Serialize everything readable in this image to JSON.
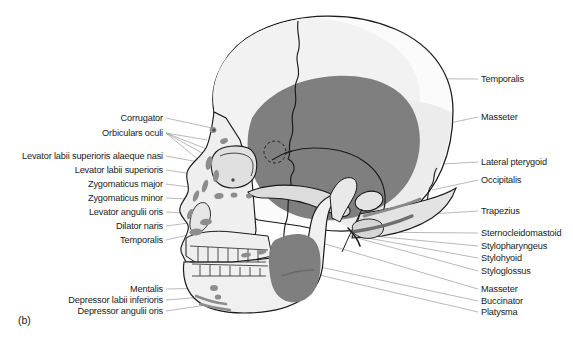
{
  "figure": {
    "caption": "(b)",
    "colors": {
      "background": "#ffffff",
      "bone_light": "#f4f4f4",
      "bone_mid": "#e2e2e2",
      "bone_shadow": "#cfcfcf",
      "muscle_dark": "#808080",
      "muscle_mark": "#9a9a9a",
      "outline": "#1a1a1a",
      "leader": "#9b9b9b",
      "text": "#1a1a1a"
    }
  },
  "labels_left": [
    {
      "text": "Corrugator",
      "x": 163,
      "y": 118,
      "tip_x": 212,
      "tip_y": 128
    },
    {
      "text": "Orbiculars oculi",
      "x": 163,
      "y": 133,
      "tip_x": 207,
      "tip_y": 140
    },
    {
      "text": "Levator labii superioris alaeque nasi",
      "x": 163,
      "y": 156,
      "tip_x": 204,
      "tip_y": 163
    },
    {
      "text": "Levator labii superioris",
      "x": 163,
      "y": 170,
      "tip_x": 206,
      "tip_y": 176
    },
    {
      "text": "Zygomaticus major",
      "x": 163,
      "y": 184,
      "tip_x": 212,
      "tip_y": 190
    },
    {
      "text": "Zygomaticus minor",
      "x": 163,
      "y": 198,
      "tip_x": 210,
      "tip_y": 200
    },
    {
      "text": "Levator angulii oris",
      "x": 163,
      "y": 212,
      "tip_x": 200,
      "tip_y": 214
    },
    {
      "text": "Dilator naris",
      "x": 163,
      "y": 226,
      "tip_x": 196,
      "tip_y": 222
    },
    {
      "text": "Temporalis",
      "x": 163,
      "y": 240,
      "tip_x": 192,
      "tip_y": 234
    },
    {
      "text": "Mentalis",
      "x": 163,
      "y": 289,
      "tip_x": 214,
      "tip_y": 288
    },
    {
      "text": "Depressor labii inferioris",
      "x": 163,
      "y": 300,
      "tip_x": 216,
      "tip_y": 296
    },
    {
      "text": "Depressor angulii oris",
      "x": 163,
      "y": 311,
      "tip_x": 220,
      "tip_y": 303
    }
  ],
  "labels_right": [
    {
      "text": "Temporalis",
      "x": 481,
      "y": 79,
      "tip_x": 315,
      "tip_y": 78
    },
    {
      "text": "Masseter",
      "x": 481,
      "y": 117,
      "tip_x": 300,
      "tip_y": 155
    },
    {
      "text": "Lateral pterygoid",
      "x": 481,
      "y": 162,
      "tip_x": 196,
      "tip_y": 178
    },
    {
      "text": "Occipitalis",
      "x": 481,
      "y": 180,
      "tip_x": 432,
      "tip_y": 190
    },
    {
      "text": "Trapezius",
      "x": 481,
      "y": 211,
      "tip_x": 398,
      "tip_y": 216
    },
    {
      "text": "Sternocleidomastoid",
      "x": 481,
      "y": 233,
      "tip_x": 355,
      "tip_y": 232
    },
    {
      "text": "Stylopharyngeus",
      "x": 481,
      "y": 246,
      "tip_x": 352,
      "tip_y": 234
    },
    {
      "text": "Stylohyoid",
      "x": 481,
      "y": 258,
      "tip_x": 351,
      "tip_y": 235
    },
    {
      "text": "Styloglossus",
      "x": 481,
      "y": 271,
      "tip_x": 350,
      "tip_y": 236
    },
    {
      "text": "Masseter",
      "x": 481,
      "y": 289,
      "tip_x": 305,
      "tip_y": 238
    },
    {
      "text": "Buccinator",
      "x": 481,
      "y": 301,
      "tip_x": 250,
      "tip_y": 252
    },
    {
      "text": "Platysma",
      "x": 481,
      "y": 312,
      "tip_x": 246,
      "tip_y": 258
    }
  ]
}
